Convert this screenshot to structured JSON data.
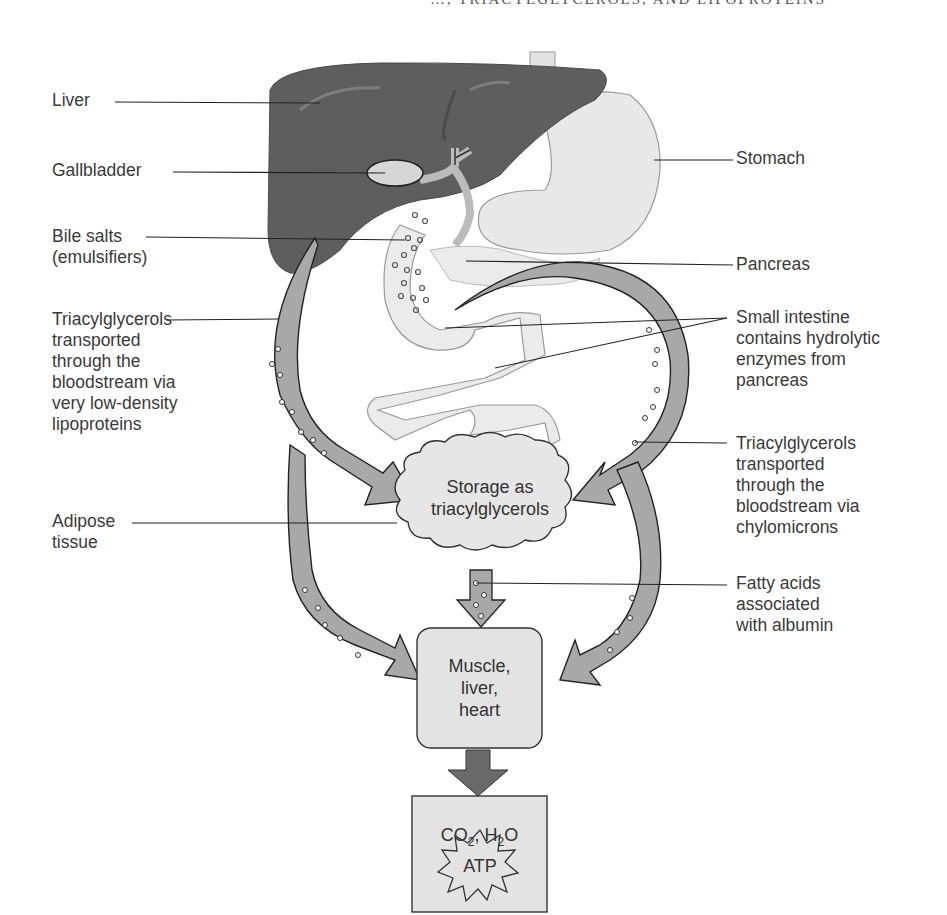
{
  "header": {
    "running_title": "…, TRIACYLGLYCEROLS, AND LIPOPROTEINS"
  },
  "labels_left": {
    "liver": "Liver",
    "gallbladder": "Gallbladder",
    "bile_salts": "Bile salts\n(emulsifiers)",
    "tag_vldl": "Triacylglycerols\ntransported\nthrough the\nbloodstream via\nvery low-density\nlipoproteins",
    "adipose": "Adipose\ntissue"
  },
  "labels_right": {
    "stomach": "Stomach",
    "pancreas": "Pancreas",
    "small_intestine": "Small intestine\ncontains hydrolytic\nenzymes from\npancreas",
    "tag_chylomicrons": "Triacylglycerols\ntransported\nthrough the\nbloodstream via\nchylomicrons",
    "fatty_acids": "Fatty acids\nassociated\nwith albumin"
  },
  "nodes": {
    "storage": "Storage as\ntriacylglycerols",
    "tissues": "Muscle,\nliver,\nheart",
    "products_co2": "CO",
    "products_co2_sub": "2",
    "products_sep": ", H",
    "products_h2o_sub": "2",
    "products_o": "O",
    "atp": "ATP"
  },
  "colors": {
    "liver": "#5e5e5e",
    "organ_light": "#e6e6e6",
    "vessel": "#a8a8a8",
    "node_fill": "#e3e3e3",
    "dark_arrow": "#6a6a6a"
  }
}
